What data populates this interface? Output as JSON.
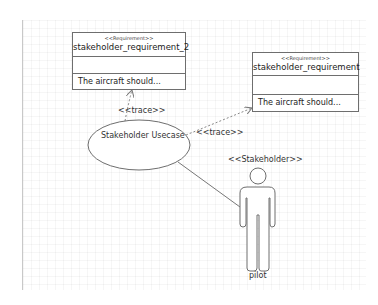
{
  "diagram": {
    "requirements": [
      {
        "id": "req2",
        "stereotype": "<<Requirement>>",
        "name": "stakeholder_requirement_2",
        "text": "The aircraft should..."
      },
      {
        "id": "req1",
        "stereotype": "<<Requirement>>",
        "name": "stakeholder_requirement",
        "text": "The aircraft should..."
      }
    ],
    "usecase": {
      "name": "Stakeholder Usecase"
    },
    "actor": {
      "stereotype": "<<Stakeholder>>",
      "name": "pilot"
    },
    "relations": [
      {
        "from": "Stakeholder Usecase",
        "to": "stakeholder_requirement_2",
        "label": "<<trace>>",
        "style": "dashed-arrow"
      },
      {
        "from": "Stakeholder Usecase",
        "to": "stakeholder_requirement",
        "label": "<<trace>>",
        "style": "dashed-arrow"
      },
      {
        "from": "Stakeholder Usecase",
        "to": "pilot",
        "label": "",
        "style": "solid-association"
      }
    ],
    "colors": {
      "line": "#6e6e6e",
      "text": "#222222",
      "background": "#ffffff"
    }
  }
}
